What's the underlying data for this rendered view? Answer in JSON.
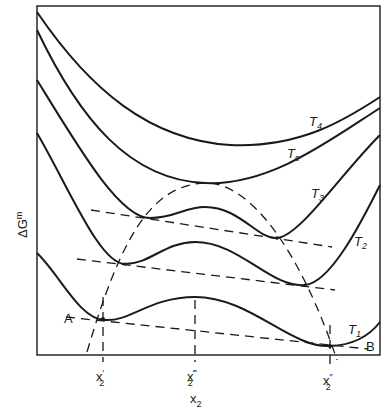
{
  "diagram": {
    "type": "free-energy-of-mixing-curves",
    "y_axis_label": "ΔG",
    "y_axis_label_sup": "m",
    "x_axis_label": "x",
    "x_axis_label_sub": "2",
    "curves": [
      {
        "id": "T4",
        "label": "T",
        "sub": "4"
      },
      {
        "id": "Tc",
        "label": "T",
        "sub": "c"
      },
      {
        "id": "T3",
        "label": "T",
        "sub": "3"
      },
      {
        "id": "T2",
        "label": "T",
        "sub": "2"
      },
      {
        "id": "T1",
        "label": "T",
        "sub": "1"
      }
    ],
    "points": {
      "A": "A",
      "B": "B"
    },
    "x_ticks": [
      {
        "id": "x2_prime",
        "label": "x",
        "sub": "2",
        "prime": "′"
      },
      {
        "id": "x2_triple_prime",
        "label": "x",
        "sub": "2",
        "prime": "‴"
      },
      {
        "id": "x2_double_prime",
        "label": "x",
        "sub": "2",
        "prime": "″"
      }
    ],
    "colors": {
      "line": "#1a1a1a",
      "background": "#ffffff"
    }
  }
}
